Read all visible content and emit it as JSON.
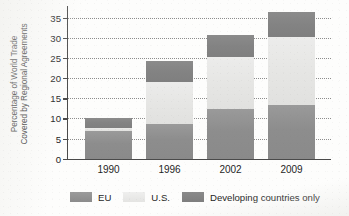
{
  "chart_data": {
    "type": "bar",
    "stacked": true,
    "title": "",
    "xlabel": "",
    "ylabel": "Percentage of World Trade Covered by Regional Agreements",
    "ylabel_lines": [
      "Percentage of World Trade",
      "Covered by Regional Agreements"
    ],
    "categories": [
      "1990",
      "1996",
      "2002",
      "2009"
    ],
    "series": [
      {
        "name": "EU",
        "values": [
          7.0,
          8.7,
          12.3,
          13.3
        ],
        "color": "#8d8d8d"
      },
      {
        "name": "U.S.",
        "values": [
          0.6,
          10.3,
          13.0,
          17.0
        ],
        "color": "#e6e6e4"
      },
      {
        "name": "Developing countries only",
        "values": [
          2.4,
          5.3,
          5.5,
          6.2
        ],
        "color": "#838383"
      }
    ],
    "totals": [
      10.0,
      24.3,
      30.8,
      36.5
    ],
    "ylim": [
      0,
      38
    ],
    "yticks": [
      0,
      5,
      10,
      15,
      20,
      25,
      30,
      35
    ],
    "ytick_labels": [
      "0",
      "5",
      "10",
      "15",
      "20",
      "25",
      "30",
      "35"
    ],
    "grid": "horizontal-dotted",
    "legend_position": "bottom"
  },
  "legend": {
    "items": [
      {
        "label": "EU",
        "swatch": "legend-swatch-eu"
      },
      {
        "label": "U.S.",
        "swatch": "legend-swatch-us"
      },
      {
        "label": "Developing countries only",
        "swatch": "legend-swatch-developing"
      }
    ]
  }
}
